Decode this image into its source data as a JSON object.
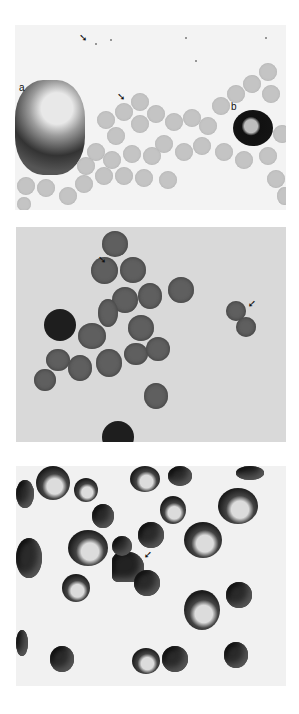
{
  "figure": {
    "panels": [
      {
        "id": "top",
        "description": "Light micrograph of red blood cells with a large irregular aggregate (a) and a dark leukocyte (b); arrows mark small particles",
        "labels": [
          "a",
          "b"
        ],
        "arrows": 2
      },
      {
        "id": "middle",
        "description": "Cluster of stained erythrocytes on gray background; arrows mark attached particles",
        "labels": [],
        "arrows": 2
      },
      {
        "id": "bottom",
        "description": "Darkly stained erythrocytes, some with pale centers; arrow marks an irregular cell aggregate",
        "labels": [],
        "arrows": 1
      }
    ],
    "label_a": "a",
    "label_b": "b",
    "arrow_glyph": "➘"
  }
}
